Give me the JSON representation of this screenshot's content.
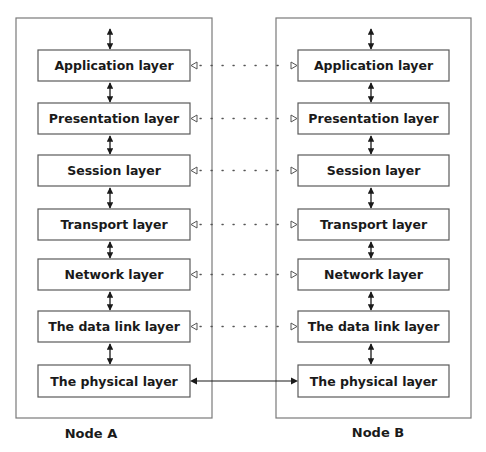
{
  "diagram": {
    "nodes": [
      {
        "id": "A",
        "label": "Node A",
        "layers": [
          "Application layer",
          "Presentation layer",
          "Session layer",
          "Transport layer",
          "Network layer",
          "The data link layer",
          "The physical layer"
        ]
      },
      {
        "id": "B",
        "label": "Node B",
        "layers": [
          "Application layer",
          "Presentation layer",
          "Session layer",
          "Transport layer",
          "Network layer",
          "The data link layer",
          "The physical layer"
        ]
      }
    ],
    "connections": [
      {
        "from": "A.Application layer",
        "to": "B.Application layer",
        "style": "dotted",
        "arrowheads": "hollow-both"
      },
      {
        "from": "A.Presentation layer",
        "to": "B.Presentation layer",
        "style": "dotted",
        "arrowheads": "hollow-both"
      },
      {
        "from": "A.Session layer",
        "to": "B.Session layer",
        "style": "dotted",
        "arrowheads": "hollow-both"
      },
      {
        "from": "A.Transport layer",
        "to": "B.Transport layer",
        "style": "dotted",
        "arrowheads": "hollow-both"
      },
      {
        "from": "A.Network layer",
        "to": "B.Network layer",
        "style": "dotted",
        "arrowheads": "hollow-both"
      },
      {
        "from": "A.The data link layer",
        "to": "B.The data link layer",
        "style": "dotted",
        "arrowheads": "hollow-both"
      },
      {
        "from": "A.The physical layer",
        "to": "B.The physical layer",
        "style": "solid",
        "arrowheads": "filled-both"
      }
    ],
    "vertical_links": "bidirectional solid arrows between adjacent layers and above the top layer",
    "colors": {
      "frame": "#7a7a7a",
      "box": "#5a5a5a",
      "text": "#1a1a1a",
      "background": "#ffffff"
    }
  }
}
